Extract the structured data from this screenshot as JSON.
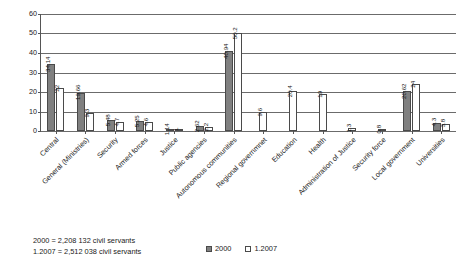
{
  "chart_data": {
    "type": "bar",
    "title": "",
    "xlabel": "",
    "ylabel": "",
    "ylim": [
      0,
      60
    ],
    "yticks": [
      0,
      10,
      20,
      30,
      40,
      50,
      60
    ],
    "grid": true,
    "legend_position": "bottom",
    "categories": [
      "Central",
      "General (Ministries)",
      "Security",
      "Armed forces",
      "Justice",
      "Public agencies",
      "Autonomous communities",
      "Regional governmnet",
      "Education",
      "Health",
      "Administration of Justice",
      "Security force",
      "Local government",
      "Universities"
    ],
    "series": [
      {
        "name": "2000",
        "color": "#808080",
        "values": [
          34.14,
          19.66,
          5.48,
          5.25,
          1.14,
          2.62,
          40.94,
          null,
          null,
          null,
          null,
          null,
          20.62,
          4.3
        ]
      },
      {
        "name": "1.2007",
        "color": "#ffffff",
        "values": [
          22,
          9.3,
          4.7,
          4.6,
          1,
          2.2,
          50.2,
          9.6,
          20.4,
          19,
          1.3,
          0.8,
          24,
          3.8
        ]
      }
    ],
    "value_labels": {
      "2000": [
        "34.14",
        "19.66",
        "5.48",
        "5.25",
        "1.14",
        "2.62",
        "40.94",
        "",
        "",
        "",
        "",
        "",
        "20.62",
        "4.3"
      ],
      "1.2007": [
        "22",
        "9.3",
        "4.7",
        "4.6",
        "1",
        "2.2",
        "50.2",
        "9.6",
        "20.4",
        "19",
        "1.3",
        "0.8",
        "24",
        "3.8"
      ]
    },
    "annotations": [
      "2000 = 2,208 132 civil servants",
      "1.2007 = 2,512 038 civil servants"
    ]
  },
  "legend": {
    "items": [
      {
        "label": "2000",
        "swatch": "filled"
      },
      {
        "label": "1.2007",
        "swatch": "hollow"
      }
    ]
  }
}
